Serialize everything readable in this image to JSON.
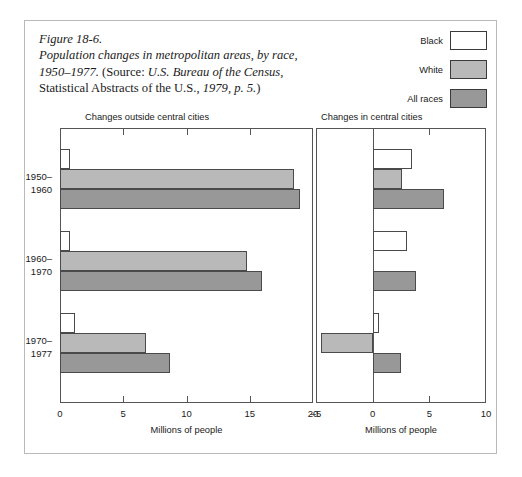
{
  "caption": {
    "line1": "Figure 18-6.",
    "line2": "Population changes in metropolitan areas, by race,",
    "line3_italic": "1950–1977.",
    "line3_roman": " (Source: ",
    "line3_italic2": "U.S. Bureau of the Census,",
    "line4_roman": "Statistical Abstracts of the U.S., ",
    "line4_italic": "1979, p. 5.",
    "line4_end": ")"
  },
  "legend": {
    "items": [
      {
        "label": "Black",
        "color": "#ffffff"
      },
      {
        "label": "White",
        "color": "#b9b9b9"
      },
      {
        "label": "All races",
        "color": "#989898"
      }
    ]
  },
  "colors": {
    "black_series": "#ffffff",
    "white_series": "#b9b9b9",
    "all_races_series": "#989898",
    "outline": "#4a4a4a",
    "frame": "#b9b9b9",
    "axis": "#555555"
  },
  "chart_data": [
    {
      "type": "bar",
      "orientation": "horizontal",
      "title": "Changes outside central cities",
      "xlabel": "Millions of people",
      "ylabel": "",
      "xlim": [
        0,
        20
      ],
      "xticks": [
        0,
        5,
        10,
        15,
        20
      ],
      "xticklabels": [
        "0",
        "5",
        "10",
        "15",
        "20"
      ],
      "grid": false,
      "categories": [
        "1950–1960",
        "1960–1970",
        "1970–1977"
      ],
      "series": [
        {
          "name": "Black",
          "values": [
            0.8,
            0.8,
            1.2
          ]
        },
        {
          "name": "White",
          "values": [
            18.5,
            14.8,
            6.8
          ]
        },
        {
          "name": "All races",
          "values": [
            19.0,
            16.0,
            8.7
          ]
        }
      ]
    },
    {
      "type": "bar",
      "orientation": "horizontal",
      "title": "Changes in central cities",
      "xlabel": "Millions of people",
      "ylabel": "",
      "xlim": [
        -5,
        10
      ],
      "xticks": [
        -5,
        0,
        5,
        10
      ],
      "xticklabels": [
        "–5",
        "0",
        "5",
        "10"
      ],
      "grid": false,
      "categories": [
        "1950–1960",
        "1960–1970",
        "1970–1977"
      ],
      "series": [
        {
          "name": "Black",
          "values": [
            3.5,
            3.0,
            0.6
          ]
        },
        {
          "name": "White",
          "values": [
            2.6,
            0.0,
            -4.6
          ]
        },
        {
          "name": "All races",
          "values": [
            6.3,
            3.8,
            2.5
          ]
        }
      ]
    }
  ]
}
